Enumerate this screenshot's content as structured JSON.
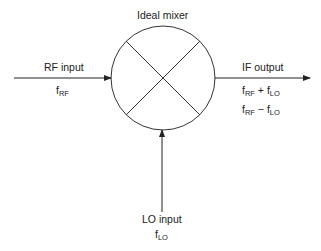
{
  "title": "Ideal mixer",
  "rf": {
    "label": "RF input",
    "freq_base": "f",
    "freq_sub": "RF"
  },
  "lo": {
    "label": "LO input",
    "freq_base": "f",
    "freq_sub": "LO"
  },
  "if": {
    "label": "IF output",
    "sum": {
      "a_base": "f",
      "a_sub": "RF",
      "op": " + ",
      "b_base": "f",
      "b_sub": "LO"
    },
    "diff": {
      "a_base": "f",
      "a_sub": "RF",
      "op": " − ",
      "b_base": "f",
      "b_sub": "LO"
    }
  },
  "colors": {
    "line": "#222222",
    "background": "#ffffff"
  }
}
